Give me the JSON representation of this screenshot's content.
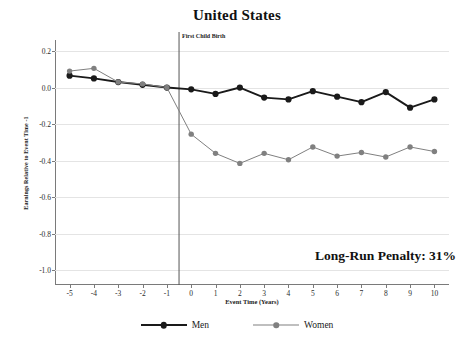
{
  "chart_data": {
    "type": "line",
    "title": "United States",
    "xlabel": "Event Time (Years)",
    "ylabel": "Earnings Relative to Event Time -1",
    "x": [
      -5,
      -4,
      -3,
      -2,
      -1,
      0,
      1,
      2,
      3,
      4,
      5,
      6,
      7,
      8,
      9,
      10
    ],
    "xlim": [
      -5.6,
      10.6
    ],
    "ylim": [
      -1.08,
      0.26
    ],
    "yticks": [
      0.2,
      0.0,
      -0.2,
      -0.4,
      -0.6,
      -0.8,
      -1.0
    ],
    "ytick_labels": [
      "0.2",
      "0.0",
      "-0.2",
      "-0.4",
      "-0.6",
      "-0.8",
      "-1.0"
    ],
    "xtick_labels": [
      "-5",
      "-4",
      "-3",
      "-2",
      "-1",
      "0",
      "1",
      "2",
      "3",
      "4",
      "5",
      "6",
      "7",
      "8",
      "9",
      "10"
    ],
    "grid": true,
    "legend_position": "below",
    "series": [
      {
        "name": "Men",
        "color": "#1a1a1a",
        "marker": "circle",
        "values": [
          0.065,
          0.05,
          0.03,
          0.015,
          0.0,
          -0.01,
          -0.035,
          0.0,
          -0.055,
          -0.065,
          -0.02,
          -0.05,
          -0.08,
          -0.025,
          -0.11,
          -0.065
        ]
      },
      {
        "name": "Women",
        "color": "#808080",
        "marker": "circle",
        "values": [
          0.09,
          0.105,
          0.03,
          0.02,
          0.0,
          -0.255,
          -0.36,
          -0.415,
          -0.36,
          -0.395,
          -0.325,
          -0.375,
          -0.355,
          -0.38,
          -0.325,
          -0.35
        ]
      }
    ],
    "annotations": [
      {
        "id": "event-line",
        "text": "First Child Birth",
        "x": -0.5,
        "type": "vertical-line"
      },
      {
        "id": "penalty",
        "text": "Long-Run Penalty: 31%",
        "type": "text"
      }
    ]
  },
  "legend": {
    "entries": [
      {
        "label": "Men",
        "color": "#1a1a1a"
      },
      {
        "label": "Women",
        "color": "#808080"
      }
    ]
  },
  "colors": {
    "men": "#1a1a1a",
    "women": "#808080",
    "axis": "#7a7a7a",
    "grid": "#e4e4e4",
    "event_line": "#555555",
    "background": "#ffffff"
  }
}
